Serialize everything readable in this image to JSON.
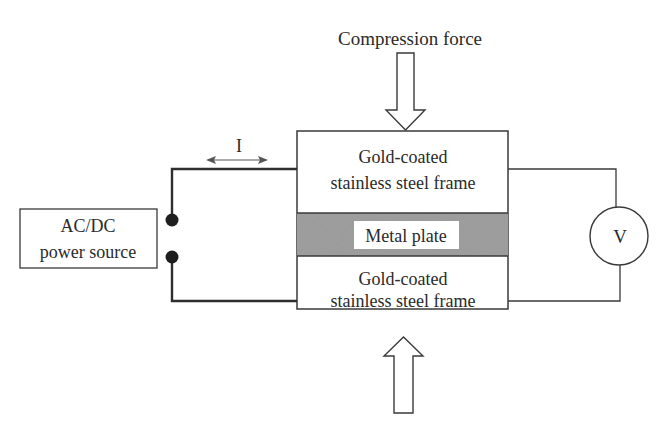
{
  "labels": {
    "compression_force": "Compression force",
    "current": "I",
    "power_source_line1": "AC/DC",
    "power_source_line2": "power source",
    "top_frame_line1": "Gold-coated",
    "top_frame_line2": "stainless steel frame",
    "metal_plate": "Metal plate",
    "bottom_frame_line1": "Gold-coated",
    "bottom_frame_line2": "stainless steel frame",
    "voltmeter": "V"
  },
  "colors": {
    "line": "#3a3a3a",
    "wire_thick": "#2e2e2e",
    "terminal": "#1e1e1e",
    "metal_plate_texture": "#8a8a8a",
    "background": "#ffffff"
  }
}
